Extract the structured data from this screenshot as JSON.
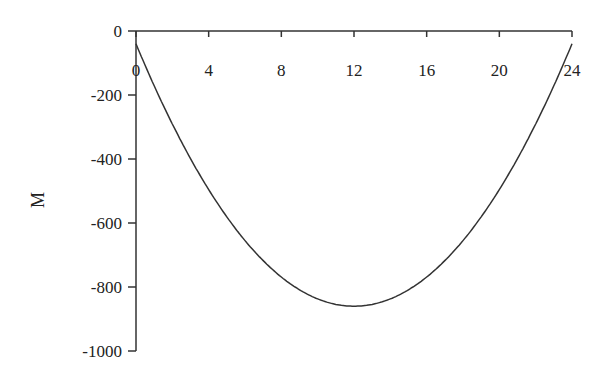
{
  "chart_data": {
    "type": "line",
    "title": "",
    "xlabel": "",
    "ylabel": "M",
    "xlim": [
      0,
      24
    ],
    "ylim": [
      -1000,
      0
    ],
    "x_ticks": [
      0,
      4,
      8,
      12,
      16,
      20,
      24
    ],
    "y_ticks": [
      0,
      -200,
      -400,
      -600,
      -800,
      -1000
    ],
    "x_tick_labels": [
      "0",
      "4",
      "8",
      "12",
      "16",
      "20",
      "24"
    ],
    "y_tick_labels": [
      "0",
      "-200",
      "-400",
      "-600",
      "-800",
      "-1000"
    ],
    "grid": false,
    "legend": null,
    "series": [
      {
        "name": "M",
        "x": [
          0,
          2,
          4,
          6,
          8,
          10,
          12,
          14,
          16,
          18,
          20,
          22,
          24
        ],
        "values": [
          -40,
          -291,
          -496,
          -655,
          -769,
          -837,
          -860,
          -837,
          -769,
          -655,
          -496,
          -291,
          -40
        ]
      }
    ]
  }
}
